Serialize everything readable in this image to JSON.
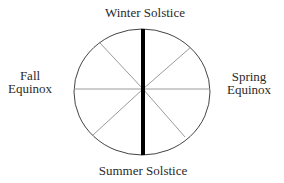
{
  "diagram": {
    "type": "seasonal-wheel",
    "labels": {
      "top": "Winter Solstice",
      "bottom": "Summer Solstice",
      "left": {
        "line1": "Fall",
        "line2": "Equinox"
      },
      "right": {
        "line1": "Spring",
        "line2": "Equinox"
      }
    },
    "colors": {
      "outline": "#444444",
      "spokes": "#9a9a9a",
      "axis": "#000000",
      "text": "#2a2a2a"
    }
  }
}
